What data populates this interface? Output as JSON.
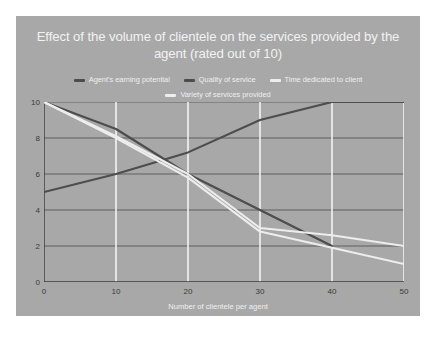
{
  "chart_data": {
    "type": "line",
    "title": "Effect of the volume of clientele on the services provided by the agent (rated out of 10)",
    "xlabel": "Number of clientele per agent",
    "ylabel": "",
    "xlim": [
      0,
      50
    ],
    "ylim": [
      0,
      10
    ],
    "xticks": [
      "0",
      "10",
      "20",
      "30",
      "40",
      "50"
    ],
    "yticks": [
      "0",
      "2",
      "4",
      "6",
      "8",
      "10"
    ],
    "grid": true,
    "legend_position": "top",
    "background_color": "#a8a8a8",
    "title_color": "#f2f2f2",
    "axis_color": "#3a3a3a",
    "gridline_color": "#ffffff",
    "series": [
      {
        "name": "Agent's earning potential",
        "color": "#4d4d4d",
        "x": [
          0,
          10,
          20,
          30,
          40,
          50
        ],
        "values": [
          5,
          6,
          7.2,
          9,
          10,
          10
        ]
      },
      {
        "name": "Quality of service",
        "color": "#4d4d4d",
        "x": [
          0,
          10,
          20,
          30,
          40
        ],
        "values": [
          10,
          8.5,
          6,
          4,
          2
        ]
      },
      {
        "name": "Time dedicated to client",
        "color": "#ededed",
        "x": [
          0,
          10,
          20,
          30,
          40,
          50
        ],
        "values": [
          10,
          8.1,
          6,
          3,
          2.6,
          2
        ]
      },
      {
        "name": "Variety of services provided",
        "color": "#ededed",
        "x": [
          0,
          10,
          20,
          30,
          40,
          50
        ],
        "values": [
          10,
          8,
          5.8,
          2.8,
          1.9,
          1
        ]
      }
    ]
  }
}
